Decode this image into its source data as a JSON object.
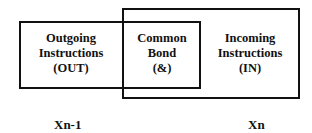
{
  "diagram": {
    "left_region": {
      "line1": "Outgoing",
      "line2": "Instructions",
      "line3": "(OUT)"
    },
    "overlap_region": {
      "line1": "Common",
      "line2": "Bond",
      "line3": "(&)"
    },
    "right_region": {
      "line1": "Incoming",
      "line2": "Instructions",
      "line3": "(IN)"
    },
    "left_label": "Xn-1",
    "right_label": "Xn"
  }
}
